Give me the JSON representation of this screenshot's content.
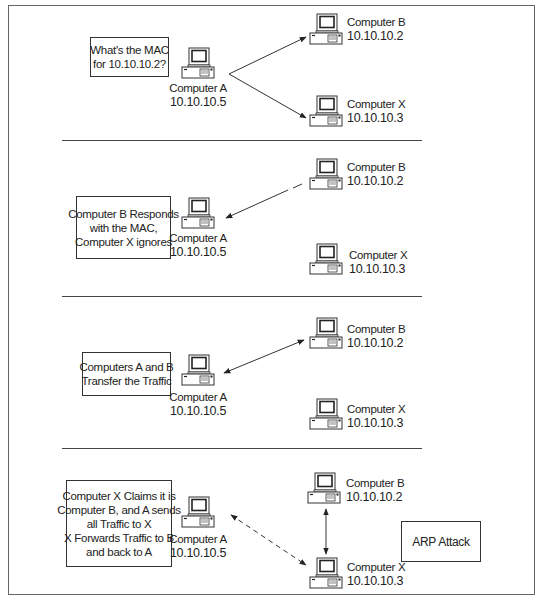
{
  "diagram": {
    "colors": {
      "line": "#333333",
      "frame": "#666666",
      "background": "#ffffff"
    },
    "panels": [
      {
        "caption": [
          "What's the MAC",
          "for 10.10.10.2?"
        ],
        "computer_a": {
          "name": "Computer A",
          "ip": "10.10.10.5"
        },
        "computer_b": {
          "name": "Computer B",
          "ip": "10.10.10.2"
        },
        "computer_x": {
          "name": "Computer X",
          "ip": "10.10.10.3"
        },
        "arrows": [
          "A -> B",
          "A -> X"
        ]
      },
      {
        "caption": [
          "Computer B Responds",
          "with the MAC,",
          "Computer X ignores"
        ],
        "computer_a": {
          "name": "Computer A",
          "ip": "10.10.10.5"
        },
        "computer_b": {
          "name": "Computer B",
          "ip": "10.10.10.2"
        },
        "computer_x": {
          "name": "Computer X",
          "ip": "10.10.10.3"
        },
        "arrows": [
          "B -> A"
        ]
      },
      {
        "caption": [
          "Computers A and B",
          "Transfer the Traffic"
        ],
        "computer_a": {
          "name": "Computer A",
          "ip": "10.10.10.5"
        },
        "computer_b": {
          "name": "Computer B",
          "ip": "10.10.10.2"
        },
        "computer_x": {
          "name": "Computer X",
          "ip": "10.10.10.3"
        },
        "arrows": [
          "A <-> B"
        ]
      },
      {
        "caption": [
          "Computer X Claims it is",
          "Computer B, and A sends",
          "all Traffic to X",
          "X Forwards Traffic to B",
          "and back to A"
        ],
        "computer_a": {
          "name": "Computer A",
          "ip": "10.10.10.5"
        },
        "computer_b": {
          "name": "Computer B",
          "ip": "10.10.10.2"
        },
        "computer_x": {
          "name": "Computer X",
          "ip": "10.10.10.3"
        },
        "arrows": [
          "A <-> X (dashed)",
          "B <-> X"
        ],
        "tag": "ARP Attack"
      }
    ]
  }
}
